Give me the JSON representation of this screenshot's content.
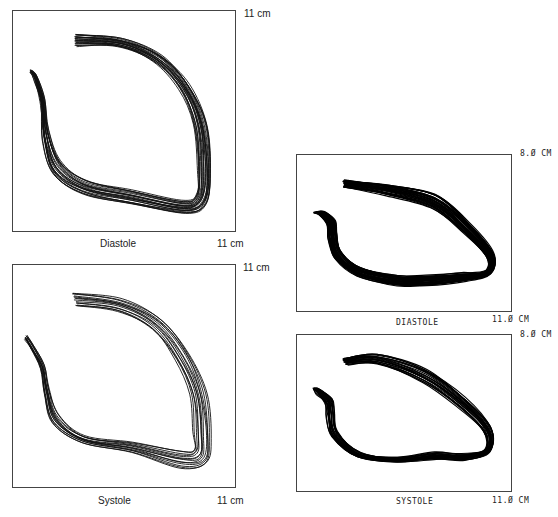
{
  "figure": {
    "left_column": {
      "style": "typeset",
      "panels": [
        {
          "id": "left-diastole",
          "caption": "Diastole",
          "y_extent_label": "11 cm",
          "x_extent_label": "11 cm",
          "contour_count": 22
        },
        {
          "id": "left-systole",
          "caption": "Systole",
          "y_extent_label": "11 cm",
          "x_extent_label": "11 cm",
          "contour_count": 14
        }
      ]
    },
    "right_column": {
      "style": "plotter",
      "panels": [
        {
          "id": "right-diastole",
          "caption": "DIASTOLE",
          "y_extent_label": "8.Ø CM",
          "x_extent_label": "11.Ø CM",
          "contour_count": 30
        },
        {
          "id": "right-systole",
          "caption": "SYSTOLE",
          "y_extent_label": "8.Ø CM",
          "x_extent_label": "11.Ø CM",
          "contour_count": 22
        }
      ]
    }
  },
  "contours": {
    "left-diastole": {
      "box": [
        224,
        222
      ],
      "base": [
        [
          63,
          23
        ],
        [
          110,
          28
        ],
        [
          150,
          45
        ],
        [
          178,
          75
        ],
        [
          195,
          115
        ],
        [
          200,
          165
        ],
        [
          195,
          195
        ],
        [
          175,
          205
        ],
        [
          120,
          195
        ],
        [
          70,
          185
        ],
        [
          40,
          165
        ],
        [
          30,
          130
        ],
        [
          28,
          95
        ],
        [
          22,
          70
        ],
        [
          18,
          62
        ]
      ],
      "spread": [
        [
          0,
          12
        ],
        [
          -4,
          8
        ],
        [
          -8,
          6
        ],
        [
          -10,
          4
        ],
        [
          -12,
          0
        ],
        [
          -14,
          -4
        ],
        [
          -10,
          -10
        ],
        [
          -4,
          -14
        ],
        [
          0,
          -14
        ],
        [
          4,
          -14
        ],
        [
          8,
          -14
        ],
        [
          6,
          -10
        ],
        [
          4,
          -6
        ],
        [
          2,
          -4
        ],
        [
          0,
          -2
        ]
      ],
      "stroke": "#111",
      "width": 0.9
    },
    "left-systole": {
      "box": [
        224,
        224
      ],
      "base": [
        [
          60,
          28
        ],
        [
          110,
          35
        ],
        [
          150,
          55
        ],
        [
          178,
          90
        ],
        [
          195,
          130
        ],
        [
          200,
          175
        ],
        [
          195,
          200
        ],
        [
          170,
          205
        ],
        [
          120,
          190
        ],
        [
          70,
          180
        ],
        [
          40,
          160
        ],
        [
          32,
          130
        ],
        [
          28,
          105
        ],
        [
          18,
          85
        ],
        [
          12,
          75
        ]
      ],
      "spread": [
        [
          4,
          14
        ],
        [
          -4,
          12
        ],
        [
          -10,
          10
        ],
        [
          -14,
          6
        ],
        [
          -16,
          0
        ],
        [
          -18,
          -8
        ],
        [
          -12,
          -14
        ],
        [
          -2,
          -18
        ],
        [
          0,
          -12
        ],
        [
          2,
          -8
        ],
        [
          6,
          -8
        ],
        [
          4,
          -6
        ],
        [
          3,
          -4
        ],
        [
          2,
          -4
        ],
        [
          2,
          -4
        ]
      ],
      "stroke": "#111",
      "width": 0.9
    },
    "right-diastole": {
      "box": [
        216,
        158
      ],
      "base": [
        [
          47,
          26
        ],
        [
          90,
          30
        ],
        [
          140,
          40
        ],
        [
          175,
          70
        ],
        [
          198,
          100
        ],
        [
          195,
          120
        ],
        [
          170,
          128
        ],
        [
          130,
          132
        ],
        [
          100,
          132
        ],
        [
          60,
          122
        ],
        [
          38,
          105
        ],
        [
          32,
          85
        ],
        [
          30,
          70
        ],
        [
          22,
          60
        ],
        [
          17,
          58
        ]
      ],
      "spread": [
        [
          0,
          6
        ],
        [
          -2,
          10
        ],
        [
          -4,
          14
        ],
        [
          -6,
          10
        ],
        [
          -6,
          4
        ],
        [
          -6,
          -2
        ],
        [
          -4,
          -8
        ],
        [
          0,
          -10
        ],
        [
          2,
          -10
        ],
        [
          4,
          -8
        ],
        [
          6,
          -8
        ],
        [
          8,
          -6
        ],
        [
          8,
          -4
        ],
        [
          6,
          -2
        ],
        [
          4,
          0
        ]
      ],
      "stroke": "#000",
      "width": 1.2
    },
    "right-systole": {
      "box": [
        216,
        160
      ],
      "base": [
        [
          46,
          24
        ],
        [
          80,
          20
        ],
        [
          130,
          35
        ],
        [
          170,
          65
        ],
        [
          195,
          95
        ],
        [
          195,
          120
        ],
        [
          170,
          128
        ],
        [
          140,
          128
        ],
        [
          100,
          130
        ],
        [
          60,
          125
        ],
        [
          35,
          105
        ],
        [
          30,
          85
        ],
        [
          28,
          70
        ],
        [
          20,
          60
        ],
        [
          16,
          55
        ]
      ],
      "spread": [
        [
          4,
          6
        ],
        [
          2,
          10
        ],
        [
          -2,
          14
        ],
        [
          -6,
          10
        ],
        [
          -6,
          4
        ],
        [
          -6,
          -2
        ],
        [
          -4,
          -6
        ],
        [
          0,
          -8
        ],
        [
          2,
          -4
        ],
        [
          4,
          -4
        ],
        [
          6,
          -6
        ],
        [
          8,
          -6
        ],
        [
          8,
          -4
        ],
        [
          6,
          -2
        ],
        [
          4,
          0
        ]
      ],
      "stroke": "#000",
      "width": 1.1
    }
  }
}
